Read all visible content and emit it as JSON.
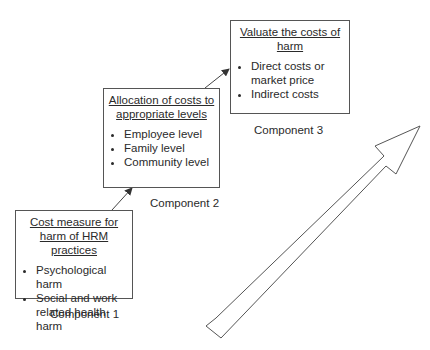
{
  "components": [
    {
      "title": "Cost measure for harm of HRM practices",
      "items": [
        "Psychological harm",
        "Social and work related health harm"
      ],
      "label": "Component 1"
    },
    {
      "title": "Allocation of costs to appropriate levels",
      "items": [
        "Employee level",
        "Family level",
        "Community level"
      ],
      "label": "Component 2"
    },
    {
      "title": "Valuate the costs of harm",
      "items": [
        "Direct costs or market price",
        "Indirect costs"
      ],
      "label": "Component 3"
    }
  ],
  "colors": {
    "line": "#555555",
    "text": "#2a2a2a",
    "background": "#ffffff"
  }
}
